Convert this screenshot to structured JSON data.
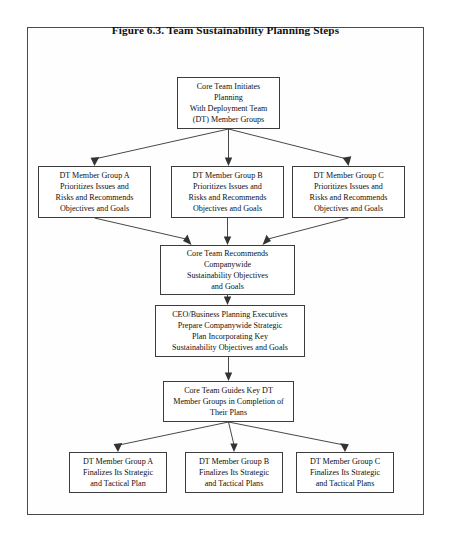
{
  "figure": {
    "title": "Figure 6.3. Team Sustainability Planning Steps"
  },
  "nodes": {
    "core_initiates": {
      "line1": "Core Team Initiates",
      "line2": "Planning",
      "line3": "With Deployment Team",
      "line4": "(DT) Member Groups"
    },
    "group_a_prioritize": {
      "line1": "DT Member Group A",
      "line2": "Prioritizes Issues and",
      "line3": "Risks and Recommends",
      "line4": "Objectives and Goals"
    },
    "group_b_prioritize": {
      "line1": "DT Member Group B",
      "line2": "Prioritizes Issues and",
      "line3": "Risks and Recommends",
      "line4": "Objectives and Goals"
    },
    "group_c_prioritize": {
      "line1": "DT Member Group C",
      "line2": "Prioritizes Issues and",
      "line3": "Risks and Recommends",
      "line4": "Objectives and Goals"
    },
    "core_recommends": {
      "line1": "Core Team Recommends",
      "line2": "Companywide",
      "line3": "Sustainability Objectives",
      "line4": "and Goals"
    },
    "ceo_plan": {
      "line1": "CEO/Business Planning Executives",
      "line2": "Prepare Companywide Strategic",
      "line3": "Plan Incorporating Key",
      "line4": "Sustainability Objectives and Goals"
    },
    "core_guides": {
      "line1": "Core Team Guides Key DT",
      "line2": "Member Groups in Completion of",
      "line3": "Their Plans"
    },
    "group_a_finalize": {
      "line1": "DT Member Group A",
      "line2": "Finalizes Its Strategic",
      "line3": "and Tactical Plan"
    },
    "group_b_finalize": {
      "line1": "DT Member Group B",
      "line2": "Finalizes Its Strategic",
      "line3": "and Tactical Plans"
    },
    "group_c_finalize": {
      "line1": "DT Member Group C",
      "line2": "Finalizes Its Strategic",
      "line3": "and Tactical Plans"
    }
  },
  "colors": {
    "box_border": "#3c3c3c",
    "page_border": "#4a4a4a",
    "connector": "#333333",
    "background": "#ffffff"
  }
}
